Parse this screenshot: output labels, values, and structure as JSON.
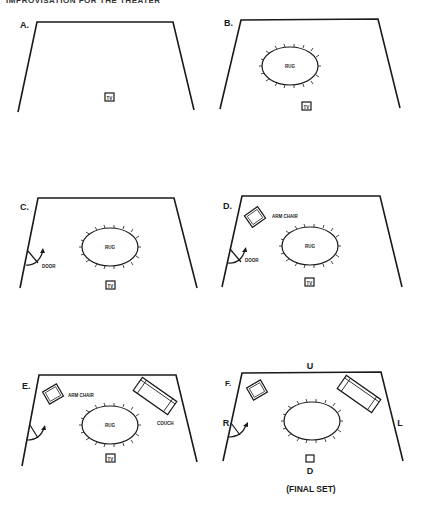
{
  "header": {
    "running_title": "IMPROVISATION FOR THE THEATER"
  },
  "panels": [
    {
      "id": "A",
      "label": "A.",
      "items": {
        "tv": "TV"
      }
    },
    {
      "id": "B",
      "label": "B.",
      "items": {
        "rug": "RUG",
        "tv": "TV"
      }
    },
    {
      "id": "C",
      "label": "C.",
      "items": {
        "rug": "RUG",
        "door": "DOOR",
        "tv": "TV"
      }
    },
    {
      "id": "D",
      "label": "D.",
      "items": {
        "arm_chair": "ARM CHAIR",
        "rug": "RUG",
        "door": "DOOR",
        "tv": "TV"
      }
    },
    {
      "id": "E",
      "label": "E.",
      "items": {
        "arm_chair": "ARM CHAIR",
        "couch": "COUCH",
        "rug": "RUG",
        "tv": "TV"
      }
    },
    {
      "id": "F",
      "label": "F.",
      "stage_directions": {
        "up": "U",
        "down": "D",
        "right": "R",
        "left": "L"
      },
      "caption": "(FINAL SET)"
    }
  ]
}
